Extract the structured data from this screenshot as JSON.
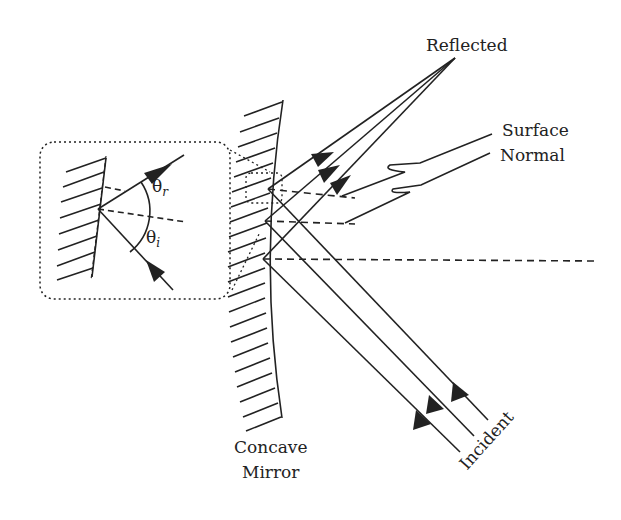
{
  "figure": {
    "type": "optics-diagram",
    "colors": {
      "ink": "#222222",
      "background": "#ffffff"
    }
  },
  "labels": {
    "reflected": "Reflected",
    "surface_normal_line1": "Surface",
    "surface_normal_line2": "Normal",
    "incident": "Incident",
    "mirror_line1": "Concave",
    "mirror_line2": "Mirror"
  },
  "inset": {
    "theta_r": "θ",
    "theta_r_sub": "r",
    "theta_i": "θ",
    "theta_i_sub": "i"
  }
}
